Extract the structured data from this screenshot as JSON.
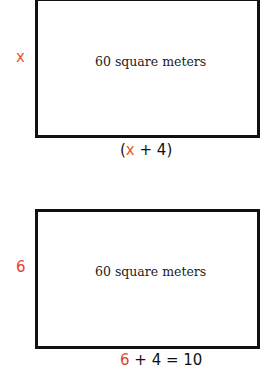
{
  "diagrams": [
    {
      "area_label": "60 square meters",
      "side_label": "x",
      "bottom_label": {
        "open": "(",
        "variable": "x",
        "rest": " + 4)"
      }
    },
    {
      "area_label": "60 square meters",
      "side_label": "6",
      "bottom_label": {
        "variable": "6",
        "rest": " + 4 = 10"
      }
    }
  ],
  "colors": {
    "variable": "#e8552b",
    "border": "#111111"
  }
}
